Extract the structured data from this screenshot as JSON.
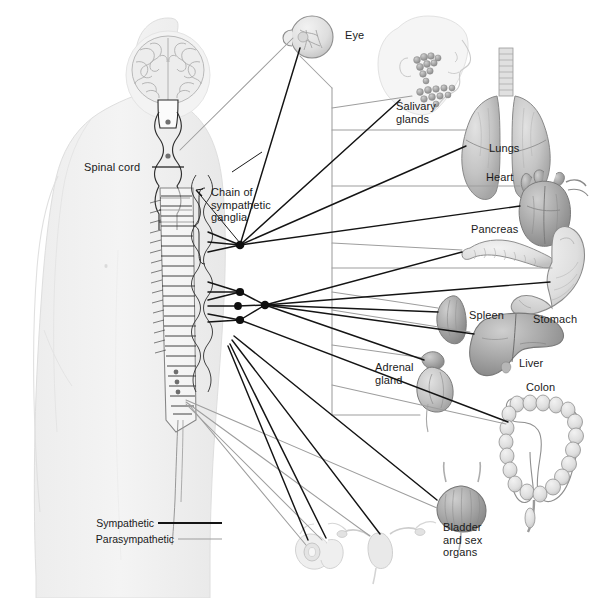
{
  "figure": {
    "colors": {
      "sympathetic_line": "#1a1a1a",
      "parasympathetic_line": "#9a9a9a",
      "body_silhouette": "#f0f0f0",
      "body_outline": "#dcdcdc",
      "organ_fill": "#c9c9c9",
      "organ_dark": "#9e9e9e",
      "background": "#ffffff",
      "text": "#1a1a1a"
    }
  },
  "labels": {
    "spinal_cord": "Spinal cord",
    "chain_of_ganglia": "Chain of\nsympathetic\nganglia",
    "eye": "Eye",
    "salivary_glands": "Salivary\nglands",
    "lungs": "Lungs",
    "heart": "Heart",
    "pancreas": "Pancreas",
    "stomach": "Stomach",
    "spleen": "Spleen",
    "liver": "Liver",
    "adrenal_gland": "Adrenal\ngland",
    "colon": "Colon",
    "bladder_sex_organs": "Bladder\nand sex\norgans"
  },
  "legend": {
    "items": [
      {
        "label": "Sympathetic",
        "color": "#1a1a1a",
        "width": 2.1
      },
      {
        "label": "Parasympathetic",
        "color": "#9a9a9a",
        "width": 1.1
      }
    ]
  },
  "organs": [
    {
      "name": "eye",
      "label": "Eye"
    },
    {
      "name": "salivary-glands",
      "label": "Salivary glands"
    },
    {
      "name": "lungs",
      "label": "Lungs"
    },
    {
      "name": "heart",
      "label": "Heart"
    },
    {
      "name": "pancreas",
      "label": "Pancreas"
    },
    {
      "name": "stomach",
      "label": "Stomach"
    },
    {
      "name": "spleen",
      "label": "Spleen"
    },
    {
      "name": "liver",
      "label": "Liver"
    },
    {
      "name": "adrenal-gland",
      "label": "Adrenal gland"
    },
    {
      "name": "colon",
      "label": "Colon"
    },
    {
      "name": "bladder",
      "label": "Bladder and sex organs"
    },
    {
      "name": "male-reproductive-organs",
      "label": ""
    },
    {
      "name": "female-reproductive-organs",
      "label": ""
    }
  ],
  "anatomy": {
    "brain": "brain",
    "spinal_cord": "spinal-cord",
    "ganglia_nodes": 5
  }
}
